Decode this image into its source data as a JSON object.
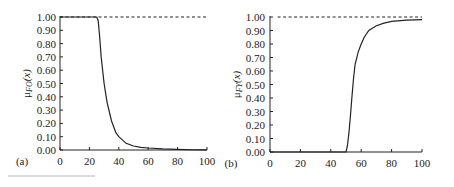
{
  "chart_data": [
    {
      "type": "line",
      "panel_label": "(a)",
      "title": "",
      "xlabel": "",
      "ylabel": "μFO(x)",
      "ylabel_main": "μ",
      "ylabel_sub": "FO",
      "ylabel_arg": "(x)",
      "xlim": [
        0,
        100
      ],
      "ylim": [
        0,
        1
      ],
      "x_ticks": [
        0,
        20,
        40,
        60,
        80,
        100
      ],
      "y_ticks": [
        "0.00",
        "0.10",
        "0.20",
        "0.30",
        "0.40",
        "0.50",
        "0.60",
        "0.70",
        "0.80",
        "0.90",
        "1.00"
      ],
      "grid": false,
      "series": [
        {
          "name": "membership",
          "style": "solid",
          "x": [
            0,
            10,
            20,
            25,
            26,
            27,
            28,
            30,
            32,
            35,
            38,
            40,
            45,
            50,
            55,
            60,
            70,
            80,
            90,
            100
          ],
          "y": [
            1.0,
            1.0,
            1.0,
            1.0,
            0.97,
            0.85,
            0.7,
            0.5,
            0.36,
            0.22,
            0.13,
            0.1,
            0.05,
            0.03,
            0.02,
            0.015,
            0.008,
            0.004,
            0.002,
            0.001
          ]
        },
        {
          "name": "reference",
          "style": "dashed",
          "x": [
            0,
            100
          ],
          "y": [
            1.0,
            1.0
          ]
        }
      ]
    },
    {
      "type": "line",
      "panel_label": "(b)",
      "title": "",
      "xlabel": "",
      "ylabel": "μFY(x)",
      "ylabel_main": "μ",
      "ylabel_sub": "FY",
      "ylabel_arg": "(x)",
      "xlim": [
        0,
        100
      ],
      "ylim": [
        0,
        1
      ],
      "x_ticks": [
        0,
        20,
        40,
        60,
        80,
        100
      ],
      "y_ticks": [
        "0.00",
        "0.10",
        "0.20",
        "0.30",
        "0.40",
        "0.50",
        "0.60",
        "0.70",
        "0.80",
        "0.90",
        "1.00"
      ],
      "grid": false,
      "series": [
        {
          "name": "membership",
          "style": "solid",
          "x": [
            0,
            10,
            20,
            30,
            40,
            50,
            51,
            52,
            53,
            54,
            55,
            56,
            58,
            60,
            62,
            65,
            70,
            75,
            80,
            90,
            100
          ],
          "y": [
            0,
            0,
            0,
            0,
            0,
            0,
            0.05,
            0.15,
            0.28,
            0.42,
            0.55,
            0.65,
            0.74,
            0.8,
            0.85,
            0.9,
            0.935,
            0.955,
            0.967,
            0.977,
            0.98
          ]
        },
        {
          "name": "reference",
          "style": "dashed",
          "x": [
            5,
            100
          ],
          "y": [
            1.0,
            1.0
          ]
        }
      ]
    }
  ]
}
